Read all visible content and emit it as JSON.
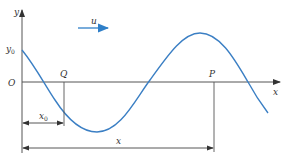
{
  "diagram": {
    "type": "transverse-wave",
    "labels": {
      "y_axis": "y",
      "x_axis": "x",
      "origin": "O",
      "y0": "y",
      "y0_sub": "0",
      "point_q": "Q",
      "point_p": "P",
      "velocity": "u",
      "x0": "x",
      "x0_sub": "0",
      "distance_x": "x"
    },
    "colors": {
      "wave": "#3b7fc4",
      "axes": "#555555",
      "velocity_arrow": "#2f7fc8",
      "dimension": "#444444"
    }
  }
}
